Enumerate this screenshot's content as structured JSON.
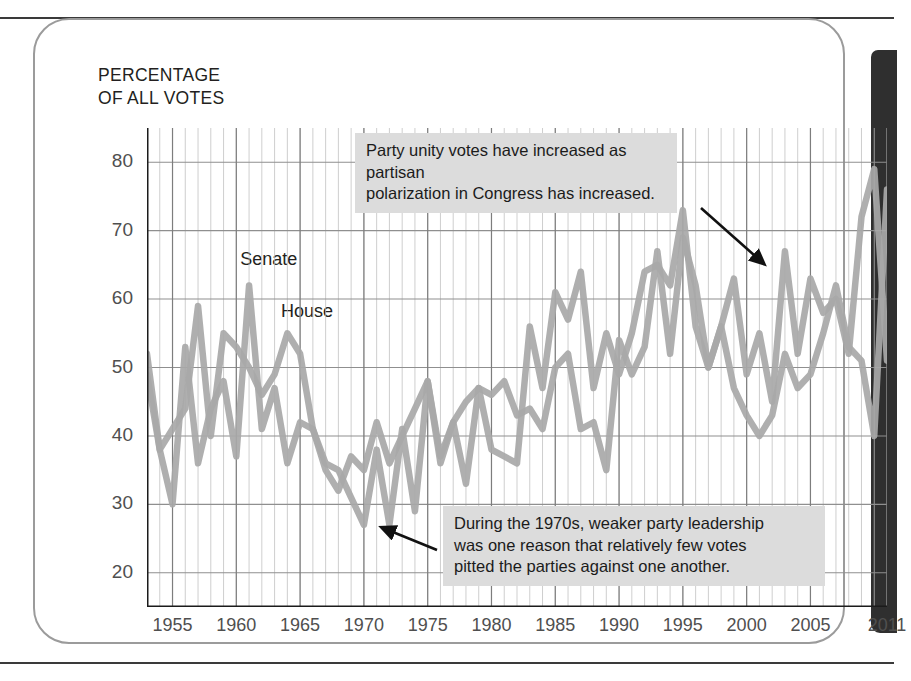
{
  "page": {
    "card_label": "chart-card"
  },
  "chart_data": {
    "type": "line",
    "title": "",
    "axis_title": "PERCENTAGE\nOF ALL VOTES",
    "xlabel": "",
    "ylabel": "Percentage of all votes",
    "xlim": [
      1953,
      2011
    ],
    "ylim": [
      15,
      85
    ],
    "yticks": [
      20,
      30,
      40,
      50,
      60,
      70,
      80
    ],
    "xticks": [
      1955,
      1960,
      1965,
      1970,
      1975,
      1980,
      1985,
      1990,
      1995,
      2000,
      2005,
      2011
    ],
    "grid": "both-minor-annual",
    "legend_position": "inline-labels",
    "line_color": "#a8a8a8",
    "grid_color": "#bfbfbf",
    "x": [
      1953,
      1954,
      1955,
      1956,
      1957,
      1958,
      1959,
      1960,
      1961,
      1962,
      1963,
      1964,
      1965,
      1966,
      1967,
      1968,
      1969,
      1970,
      1971,
      1972,
      1973,
      1974,
      1975,
      1976,
      1977,
      1978,
      1979,
      1980,
      1981,
      1982,
      1983,
      1984,
      1985,
      1986,
      1987,
      1988,
      1989,
      1990,
      1991,
      1992,
      1993,
      1994,
      1995,
      1996,
      1997,
      1998,
      1999,
      2000,
      2001,
      2002,
      2003,
      2004,
      2005,
      2006,
      2007,
      2008,
      2009,
      2010,
      2011
    ],
    "series": [
      {
        "name": "Senate",
        "values": [
          49,
          38,
          30,
          53,
          36,
          44,
          48,
          37,
          62,
          41,
          47,
          36,
          42,
          41,
          35,
          32,
          37,
          35,
          42,
          36,
          40,
          44,
          48,
          37,
          42,
          45,
          47,
          46,
          48,
          43,
          44,
          41,
          50,
          52,
          41,
          42,
          35,
          54,
          49,
          53,
          67,
          52,
          69,
          62,
          50,
          56,
          63,
          49,
          55,
          45,
          67,
          52,
          63,
          58,
          60,
          52,
          72,
          79,
          51
        ],
        "label_pos": {
          "x": 1960.3,
          "y": 65.5
        }
      },
      {
        "name": "House",
        "values": [
          52,
          38,
          41,
          44,
          59,
          40,
          55,
          53,
          50,
          46,
          49,
          55,
          52,
          41,
          36,
          35,
          31,
          27,
          38,
          27,
          41,
          29,
          48,
          36,
          42,
          33,
          47,
          38,
          37,
          36,
          56,
          47,
          61,
          57,
          64,
          47,
          55,
          49,
          55,
          64,
          65,
          62,
          73,
          56,
          50,
          56,
          47,
          43,
          40,
          43,
          52,
          47,
          49,
          55,
          62,
          53,
          51,
          40,
          76
        ],
        "label_pos": {
          "x": 1963.5,
          "y": 58.0
        }
      }
    ],
    "annotations": [
      {
        "id": "annotation-polarization",
        "text": "Party unity votes have increased as partisan\npolarization in Congress has increased.",
        "box": {
          "left": 320,
          "top": 113,
          "width": 300
        },
        "arrow": {
          "x1": 666,
          "y1": 188,
          "x2": 728,
          "y2": 243
        }
      },
      {
        "id": "annotation-1970s",
        "text": "During the 1970s, weaker party leadership\nwas one reason that relatively few votes\npitted the parties against one another.",
        "box": {
          "left": 408,
          "top": 486,
          "width": 360
        },
        "arrow": {
          "x1": 402,
          "y1": 530,
          "x2": 348,
          "y2": 508
        }
      }
    ]
  }
}
